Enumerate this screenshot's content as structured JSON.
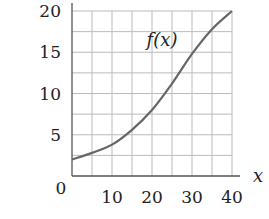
{
  "chart_data": {
    "type": "line",
    "title": "",
    "xlabel": "x",
    "ylabel": "",
    "series": [
      {
        "name": "f(x)",
        "x": [
          0,
          5,
          10,
          15,
          20,
          25,
          30,
          35,
          40
        ],
        "values": [
          2.0,
          2.8,
          3.8,
          5.6,
          8.0,
          11.2,
          14.8,
          17.8,
          20.0
        ]
      }
    ],
    "xlim": [
      0,
      40
    ],
    "ylim": [
      0,
      20
    ],
    "x_ticks": [
      0,
      10,
      20,
      30,
      40
    ],
    "y_ticks": [
      0,
      5,
      10,
      15,
      20
    ],
    "x_tick_labels": [
      "10",
      "20",
      "30",
      "40"
    ],
    "y_tick_labels": [
      "5",
      "10",
      "15",
      "20"
    ],
    "origin_label": "0",
    "grid": {
      "on": true,
      "x_step": 5,
      "y_step": 2.5
    },
    "annotations": [
      {
        "text": "f(x)",
        "x": 22.5,
        "y": 16.5
      }
    ],
    "legend": "none",
    "colors": {
      "curve": "#666666",
      "grid": "#bbbbbb",
      "axis": "#555555",
      "text": "#222222"
    }
  }
}
